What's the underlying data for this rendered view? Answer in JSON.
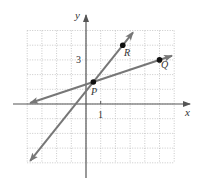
{
  "chart_data": {
    "type": "line",
    "title": "",
    "xlabel": "x",
    "ylabel": "y",
    "xlim": [
      -4,
      6
    ],
    "ylim": [
      -4,
      5
    ],
    "grid": true,
    "grid_style": "dotted",
    "tick_labels": {
      "x": [
        {
          "value": 1,
          "label": "1"
        }
      ],
      "y": [
        {
          "value": 3,
          "label": "3"
        }
      ]
    },
    "points": [
      {
        "name": "P",
        "x": 0.5,
        "y": 1.5
      },
      {
        "name": "R",
        "x": 2.5,
        "y": 4
      },
      {
        "name": "Q",
        "x": 5,
        "y": 3
      }
    ],
    "series": [
      {
        "name": "line PR",
        "slope": 1.25,
        "through": "P,R",
        "x": [
          -3.8,
          3.2
        ],
        "y": [
          -3.875,
          4.875
        ],
        "arrows": "both"
      },
      {
        "name": "line PQ",
        "slope": 0.3333,
        "through": "P,Q",
        "x": [
          -3.8,
          5.85
        ],
        "y": [
          0.067,
          3.283
        ],
        "arrows": "both"
      }
    ],
    "legend": "none"
  },
  "labels": {
    "x_axis": "x",
    "y_axis": "y",
    "x_tick": "1",
    "y_tick": "3",
    "point_p": "P",
    "point_q": "Q",
    "point_r": "R"
  },
  "colors": {
    "line": "#777777",
    "axis": "#555555",
    "grid": "#bbbbbb",
    "point": "#111111"
  }
}
